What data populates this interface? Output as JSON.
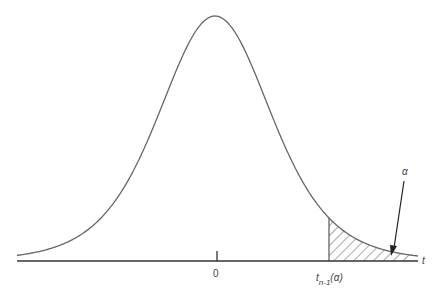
{
  "diagram": {
    "type": "t-distribution upper tail probability",
    "curve": {
      "name": "t density (bell-shaped)",
      "peak_x": 215,
      "peak_y": 16,
      "center_label": "0"
    },
    "axis": {
      "label": "t"
    },
    "critical_value": {
      "label_main": "t",
      "label_sub": "n-1",
      "label_arg": "(α)"
    },
    "tail_area": {
      "label": "α",
      "fill": "hatched"
    },
    "colors": {
      "line": "#555555",
      "axis": "#333333",
      "text": "#444444"
    }
  }
}
